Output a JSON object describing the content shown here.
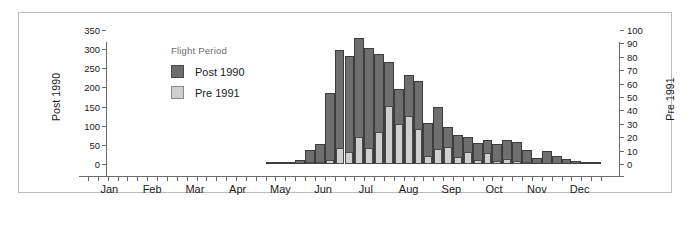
{
  "chart_data": {
    "type": "bar",
    "title": "",
    "subtitle": "",
    "xlabel": "",
    "ylabel": "Post 1990",
    "y2label": "Pre 1991",
    "ylim": [
      0,
      350
    ],
    "y2lim": [
      0,
      100
    ],
    "yticks": [
      0,
      50,
      100,
      150,
      200,
      250,
      300,
      350
    ],
    "y2ticks": [
      0,
      10,
      20,
      30,
      40,
      50,
      60,
      70,
      80,
      90,
      100
    ],
    "grid": false,
    "legend": {
      "position": "upper-left-inside",
      "title": "Flight Period",
      "entries": [
        {
          "name": "Post 1990",
          "color": "#6e6e6e"
        },
        {
          "name": "Pre 1991",
          "color": "#cfcfcf"
        }
      ]
    },
    "xtick_labels": [
      "Jan",
      "Feb",
      "Mar",
      "Apr",
      "May",
      "Jun",
      "Jul",
      "Aug",
      "Sep",
      "Oct",
      "Nov",
      "Dec"
    ],
    "x_unit": "week",
    "x": [
      1,
      2,
      3,
      4,
      5,
      6,
      7,
      8,
      9,
      10,
      11,
      12,
      13,
      14,
      15,
      16,
      17,
      18,
      19,
      20,
      21,
      22,
      23,
      24,
      25,
      26,
      27,
      28,
      29,
      30,
      31,
      32,
      33,
      34,
      35,
      36,
      37,
      38,
      39,
      40,
      41,
      42,
      43,
      44,
      45,
      46,
      47,
      48,
      49,
      50,
      51,
      52
    ],
    "series": [
      {
        "name": "Post 1990",
        "axis": "left",
        "color": "#6e6e6e",
        "values": [
          0,
          0,
          0,
          0,
          0,
          0,
          0,
          0,
          0,
          0,
          0,
          0,
          0,
          0,
          0,
          0,
          0,
          0,
          2,
          4,
          4,
          10,
          36,
          52,
          185,
          297,
          283,
          329,
          304,
          288,
          266,
          197,
          232,
          218,
          107,
          148,
          96,
          76,
          71,
          55,
          62,
          52,
          64,
          57,
          36,
          17,
          33,
          20,
          13,
          8,
          3,
          1
        ]
      },
      {
        "name": "Pre 1991",
        "axis": "right",
        "color": "#cfcfcf",
        "values": [
          0,
          0,
          0,
          0,
          0,
          0,
          0,
          0,
          0,
          0,
          0,
          0,
          0,
          0,
          0,
          0,
          0,
          0,
          0,
          0,
          0,
          0,
          1,
          1,
          3,
          12,
          9,
          20,
          12,
          24,
          43,
          30,
          36,
          26,
          6,
          11,
          13,
          5,
          9,
          3,
          8,
          2,
          4,
          2,
          1,
          0,
          0,
          0,
          0,
          0,
          0,
          0
        ]
      }
    ]
  },
  "axes": {
    "left_title": "Post 1990",
    "right_title": "Pre 1991"
  }
}
